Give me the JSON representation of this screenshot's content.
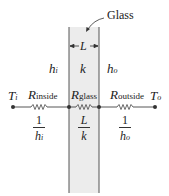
{
  "diagram": {
    "title_label": "Glass",
    "slab": {
      "thickness_label": "L",
      "conductivity_label": "k",
      "fill": "#ececec",
      "edge": "#555555"
    },
    "convection": {
      "inside": {
        "symbol": "h",
        "subscript": "i"
      },
      "outside": {
        "symbol": "h",
        "subscript": "o"
      }
    },
    "nodes": {
      "inside_temp": {
        "symbol": "T",
        "subscript": "i"
      },
      "outside_temp": {
        "symbol": "T",
        "subscript": "o"
      }
    },
    "resistors": [
      {
        "symbol": "R",
        "subscript": "inside",
        "value_num": "1",
        "value_den_symbol": "h",
        "value_den_sub": "i"
      },
      {
        "symbol": "R",
        "subscript": "glass",
        "value_num": "L",
        "value_den_symbol": "k",
        "value_den_sub": ""
      },
      {
        "symbol": "R",
        "subscript": "outside",
        "value_num": "1",
        "value_den_symbol": "h",
        "value_den_sub": "o"
      }
    ]
  }
}
